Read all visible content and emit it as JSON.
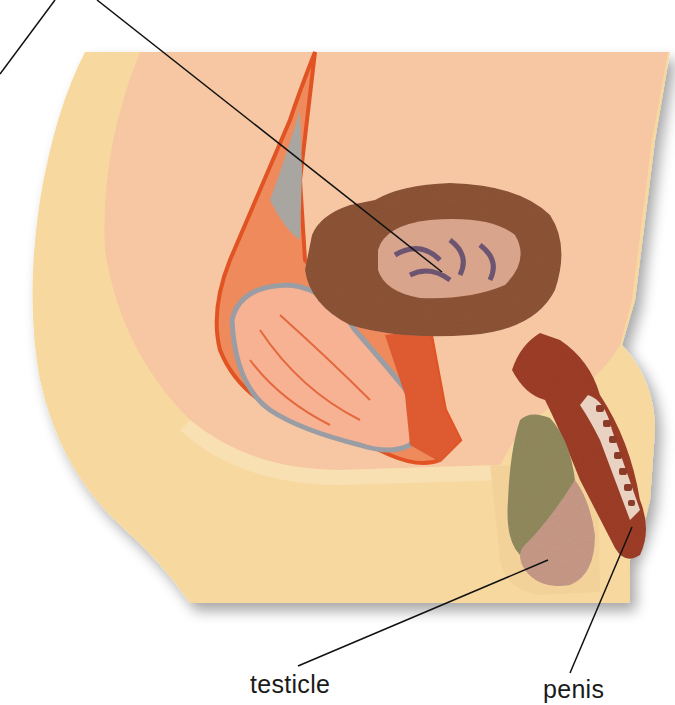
{
  "figure": {
    "type": "anatomical model photograph",
    "colors": {
      "board_outer": "#f7d9a0",
      "board_inner": "#f6c7a2",
      "bladder": "#8b5234",
      "bladder_inner": "#d9a58e",
      "rectum": "#f19a72",
      "tract_outline": "#e8582a",
      "penis": "#9e3d25",
      "testicle": "#c99a88",
      "epididymis": "#8f8a5c",
      "label_line": "#111111"
    }
  },
  "labels": [
    {
      "id": "testicle",
      "text": "testicle"
    },
    {
      "id": "penis",
      "text": "penis"
    }
  ]
}
